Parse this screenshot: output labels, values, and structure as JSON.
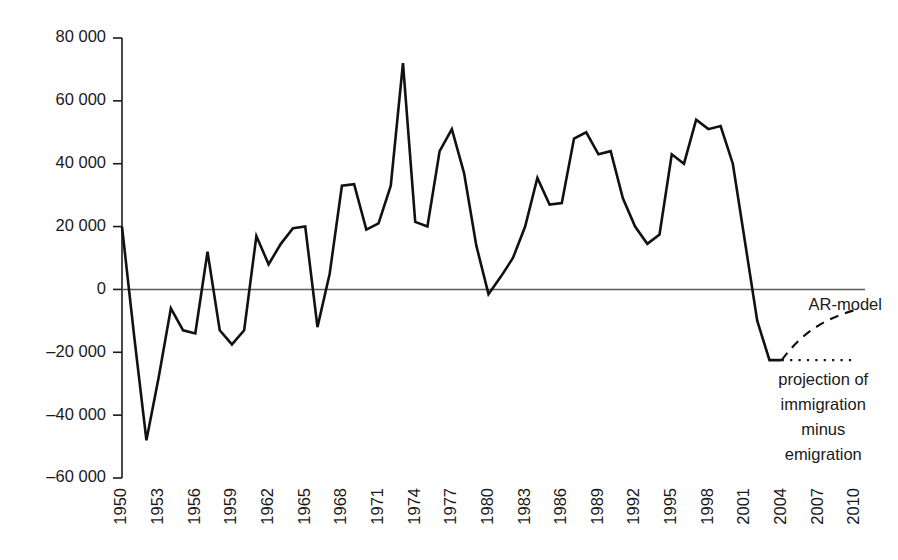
{
  "chart_data": {
    "type": "line",
    "title": "",
    "subtitle": "",
    "xlabel": "",
    "ylabel": "",
    "xlim": [
      1950,
      2010
    ],
    "ylim": [
      -60000,
      80000
    ],
    "grid": false,
    "legend_position": "none",
    "y_ticks": [
      80000,
      60000,
      40000,
      20000,
      0,
      -20000,
      -40000,
      -60000
    ],
    "y_tick_labels": [
      "80 000",
      "60 000",
      "40 000",
      "20 000",
      "0",
      "–20 000",
      "–40 000",
      "–60 000"
    ],
    "x_ticks": [
      1950,
      1953,
      1956,
      1959,
      1962,
      1965,
      1968,
      1971,
      1974,
      1977,
      1980,
      1983,
      1986,
      1989,
      1992,
      1995,
      1998,
      2001,
      2004,
      2007,
      2010
    ],
    "x_tick_labels": [
      "1950",
      "1953",
      "1956",
      "1959",
      "1962",
      "1965",
      "1968",
      "1971",
      "1974",
      "1977",
      "1980",
      "1983",
      "1986",
      "1989",
      "1992",
      "1995",
      "1998",
      "2001",
      "2004",
      "2007",
      "2010"
    ],
    "x": [
      1950,
      1951,
      1952,
      1953,
      1954,
      1955,
      1956,
      1957,
      1958,
      1959,
      1960,
      1961,
      1962,
      1963,
      1964,
      1965,
      1966,
      1967,
      1968,
      1969,
      1970,
      1971,
      1972,
      1973,
      1974,
      1975,
      1976,
      1977,
      1978,
      1979,
      1980,
      1981,
      1982,
      1983,
      1984,
      1985,
      1986,
      1987,
      1988,
      1989,
      1990,
      1991,
      1992,
      1993,
      1994,
      1995,
      1996,
      1997,
      1998,
      1999,
      2000,
      2001,
      2002,
      2003,
      2004
    ],
    "values": [
      20000,
      -15000,
      -48000,
      -28000,
      -6000,
      -13000,
      -14000,
      12000,
      -13000,
      -17500,
      -13000,
      17000,
      8000,
      14500,
      19500,
      20000,
      -12000,
      5000,
      33000,
      33500,
      19000,
      21000,
      33000,
      72000,
      21500,
      20000,
      44000,
      51000,
      37000,
      14000,
      -1500,
      4000,
      10000,
      20000,
      35500,
      27000,
      27500,
      48000,
      50000,
      43000,
      44000,
      29000,
      20000,
      14500,
      17500,
      43000,
      40000,
      54000,
      51000,
      52000,
      40000,
      15000,
      -10000,
      -22500,
      -22500
    ],
    "series": [
      {
        "name": "net migration",
        "style": "solid",
        "color": "#111111"
      },
      {
        "name": "AR-model",
        "style": "dashed",
        "color": "#111111",
        "x": [
          2004,
          2006,
          2008,
          2010
        ],
        "values": [
          -22500,
          -15500,
          -10000,
          -6500
        ]
      },
      {
        "name": "projection of immigration minus emigration",
        "style": "dotted",
        "color": "#111111",
        "x": [
          2004,
          2010
        ],
        "values": [
          -22500,
          -22500
        ]
      }
    ],
    "annotations": [
      {
        "id": "ar-model",
        "text": "AR-model",
        "x": 2006.2,
        "y": -5000,
        "align": "start"
      },
      {
        "id": "projection-caption",
        "lines": [
          "projection of",
          "immigration",
          "minus",
          "emigration"
        ],
        "x": 2007.4,
        "y": -29000,
        "align": "center"
      }
    ]
  },
  "annotations": {
    "ar_model_label": "AR-model",
    "projection_line_1": "projection of",
    "projection_line_2": "immigration",
    "projection_line_3": "minus",
    "projection_line_4": "emigration"
  }
}
